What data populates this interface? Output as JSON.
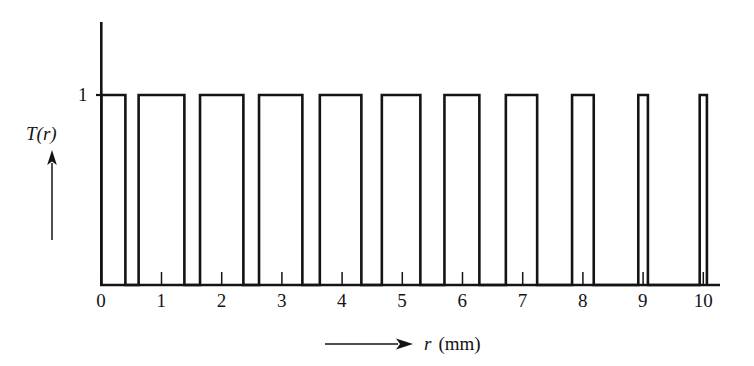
{
  "figure": {
    "kind": "line-plot",
    "background": "#ffffff",
    "ink_color": "#141414"
  },
  "axes": {
    "y_axis_name": "T(r)",
    "y_axis_arrow": "up-arrow",
    "y_tick_labels": [
      "1"
    ],
    "y_tick_values": [
      1
    ],
    "y_range": [
      0,
      1.28
    ],
    "x_axis_name_italic": "r",
    "x_axis_name_unit": "(mm)",
    "x_axis_arrow": "right-arrow",
    "x_tick_labels": [
      "0",
      "1",
      "2",
      "3",
      "4",
      "5",
      "6",
      "7",
      "8",
      "9",
      "10"
    ],
    "x_tick_values": [
      0,
      1,
      2,
      3,
      4,
      5,
      6,
      7,
      8,
      9,
      10
    ],
    "x_range": [
      0,
      10.35
    ]
  },
  "chart_data": {
    "type": "line",
    "title": "",
    "xlabel": "r (mm)",
    "ylabel": "T(r)",
    "xlim": [
      0,
      10.35
    ],
    "ylim": [
      0,
      1.28
    ],
    "grid": false,
    "legend": null,
    "series": [
      {
        "name": "T(r)",
        "style": "square-wave",
        "line_color": "#141414",
        "line_width": 2.6,
        "x": [
          0,
          10
        ],
        "y_levels": [
          0,
          1
        ],
        "bars": [
          {
            "index": 1,
            "x_start": 0.0,
            "x_end": 0.4,
            "height": 1
          },
          {
            "index": 2,
            "x_start": 0.62,
            "x_end": 1.38,
            "height": 1
          },
          {
            "index": 3,
            "x_start": 1.64,
            "x_end": 2.36,
            "height": 1
          },
          {
            "index": 4,
            "x_start": 2.62,
            "x_end": 3.34,
            "height": 1
          },
          {
            "index": 5,
            "x_start": 3.63,
            "x_end": 4.32,
            "height": 1
          },
          {
            "index": 6,
            "x_start": 4.66,
            "x_end": 5.3,
            "height": 1
          },
          {
            "index": 7,
            "x_start": 5.7,
            "x_end": 6.28,
            "height": 1
          },
          {
            "index": 8,
            "x_start": 6.72,
            "x_end": 7.24,
            "height": 1
          },
          {
            "index": 9,
            "x_start": 7.82,
            "x_end": 8.18,
            "height": 1
          },
          {
            "index": 10,
            "x_start": 8.92,
            "x_end": 9.08,
            "height": 1
          },
          {
            "index": 11,
            "x_start": 9.94,
            "x_end": 10.06,
            "height": 1
          }
        ]
      }
    ]
  }
}
